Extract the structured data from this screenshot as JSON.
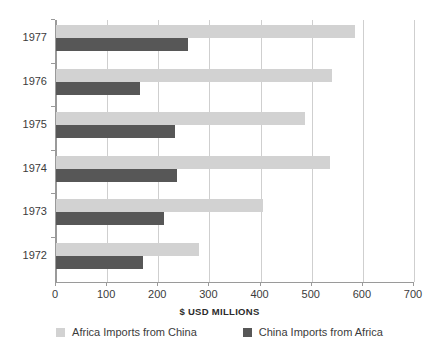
{
  "chart_data": {
    "type": "bar",
    "orientation": "horizontal",
    "title": "",
    "xlabel": "$ USD MILLIONS",
    "ylabel": "",
    "categories": [
      "1977",
      "1976",
      "1975",
      "1974",
      "1973",
      "1972"
    ],
    "series": [
      {
        "name": "Africa Imports from China",
        "color": "#d2d2d2",
        "values": [
          585,
          540,
          487,
          535,
          404,
          280
        ]
      },
      {
        "name": "China Imports from Africa",
        "color": "#575757",
        "values": [
          258,
          165,
          232,
          237,
          212,
          170
        ]
      }
    ],
    "xlim": [
      0,
      700
    ],
    "xticks": [
      "0",
      "100",
      "200",
      "300",
      "400",
      "500",
      "600",
      "700"
    ],
    "grid": true,
    "legend_position": "bottom"
  },
  "axis": {
    "x_title": "$ USD MILLIONS"
  },
  "legend": {
    "items": [
      {
        "label": "Africa Imports from China"
      },
      {
        "label": "China Imports from Africa"
      }
    ]
  }
}
